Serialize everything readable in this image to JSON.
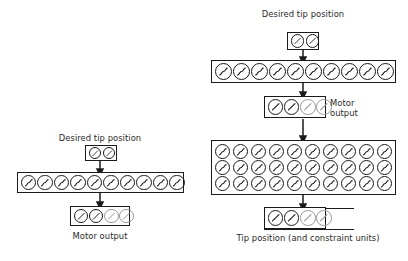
{
  "figure": {
    "background": "#ffffff",
    "ink": "#1a1a1a",
    "muted_ink": "#9a9a9a"
  },
  "diagrams": [
    {
      "id": "left-network",
      "name": "simple-arm-network",
      "labels": {
        "input": "Desired tip position",
        "output": "Motor output"
      },
      "layers": [
        {
          "name": "input-layer",
          "role": "desired tip position",
          "rows": 1,
          "columns": 2,
          "unit_glyph": "slash",
          "unit_shades": [
            "dark",
            "dark"
          ]
        },
        {
          "name": "hidden-layer",
          "role": "hidden sigmoid units",
          "rows": 1,
          "columns": 10,
          "unit_glyph": "sigmoid",
          "unit_shades": [
            "dark",
            "dark",
            "dark",
            "dark",
            "dark",
            "dark",
            "dark",
            "dark",
            "dark",
            "dark"
          ]
        },
        {
          "name": "output-layer",
          "role": "motor output",
          "rows": 1,
          "columns": 4,
          "unit_glyph": "slash",
          "unit_shades": [
            "dark",
            "dark",
            "gray",
            "gray"
          ]
        }
      ],
      "arrows": 2
    },
    {
      "id": "right-network",
      "name": "redundant-arm-network",
      "labels": {
        "input": "Desired tip position",
        "motor_output": "Motor\noutput",
        "motor_output_line1": "Motor",
        "motor_output_line2": "output",
        "bottom": "Tip position (and constraint units)"
      },
      "layers": [
        {
          "name": "input-layer",
          "role": "desired tip position",
          "rows": 1,
          "columns": 2,
          "unit_glyph": "slash",
          "unit_shades": [
            "dark",
            "dark"
          ]
        },
        {
          "name": "hidden-layer-1",
          "role": "hidden sigmoid units",
          "rows": 1,
          "columns": 10,
          "unit_glyph": "sigmoid",
          "unit_shades": [
            "dark",
            "dark",
            "dark",
            "dark",
            "dark",
            "dark",
            "dark",
            "dark",
            "dark",
            "dark"
          ]
        },
        {
          "name": "motor-output-layer",
          "role": "motor output",
          "rows": 1,
          "columns": 4,
          "unit_glyph": "slash",
          "unit_shades": [
            "dark",
            "dark",
            "gray",
            "gray"
          ]
        },
        {
          "name": "hidden-layer-2",
          "role": "forward model hidden units",
          "rows": 3,
          "columns": 10,
          "unit_glyph": "sigmoid",
          "unit_shades": [
            "dark",
            "dark",
            "dark",
            "dark",
            "dark",
            "dark",
            "dark",
            "dark",
            "dark",
            "dark"
          ]
        },
        {
          "name": "tip-position-layer",
          "role": "tip position and constraint units",
          "rows": 1,
          "columns": 4,
          "unit_glyph": "slash",
          "unit_shades": [
            "dark",
            "dark",
            "gray",
            "gray"
          ],
          "extends_right": true
        }
      ],
      "arrows": 4
    }
  ]
}
